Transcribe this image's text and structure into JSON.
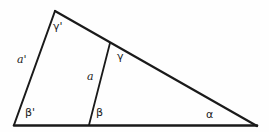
{
  "figure": {
    "background_color": "#fefefe",
    "stroke_color": "#1a1a1a",
    "width": 269,
    "height": 132,
    "points": {
      "apex": {
        "x": 55,
        "y": 11
      },
      "bottom_left": {
        "x": 14,
        "y": 125
      },
      "bottom_right": {
        "x": 257,
        "y": 126
      },
      "cevian_top": {
        "x": 110,
        "y": 43
      },
      "cevian_foot": {
        "x": 89,
        "y": 125
      }
    },
    "edges": [
      {
        "name": "left-side",
        "from": "apex",
        "to": "bottom_left",
        "width": 2.0
      },
      {
        "name": "hypotenuse",
        "from": "apex",
        "to": "bottom_right",
        "width": 2.2
      },
      {
        "name": "base",
        "from": "bottom_left",
        "to": "bottom_right",
        "width": 2.6
      },
      {
        "name": "cevian",
        "from": "cevian_top",
        "to": "cevian_foot",
        "width": 1.8
      }
    ],
    "labels": {
      "gamma_prime": "γ'",
      "a_prime": "a'",
      "beta_prime": "β'",
      "a_side": "a",
      "gamma": "γ",
      "beta": "β",
      "alpha": "α"
    }
  }
}
